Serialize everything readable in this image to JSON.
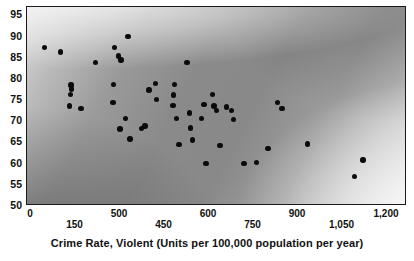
{
  "chart_data": {
    "type": "scatter",
    "title": "",
    "xlabel": "Crime Rate, Violent (Units per 100,000 population per year)",
    "ylabel": "",
    "xlim": [
      0,
      1300
    ],
    "ylim": [
      50,
      97
    ],
    "grid": false,
    "legend": null,
    "marker": {
      "shape": "circle",
      "color": "#0b0b0b",
      "filled": true
    },
    "background": {
      "style": "grayscale-gradient",
      "description": "dark gray in lower-left and upper-right, bright diagonal band from upper-left through centre to lower-right",
      "dark": "#8a8a8a",
      "light": "#e2e2e2"
    },
    "xticks_top": [
      "0",
      "500",
      "600",
      "900",
      "1,200"
    ],
    "xticks_bottom": [
      "150",
      "450",
      "750",
      "1,050"
    ],
    "xticks_all": [
      "0",
      "150",
      "500",
      "450",
      "600",
      "750",
      "900",
      "1,050",
      "1,200"
    ],
    "yticks": [
      "95",
      "90",
      "85",
      "80",
      "75",
      "70",
      "65",
      "60",
      "55",
      "50"
    ],
    "n_points": 60,
    "points": [
      {
        "x": 60,
        "y": 87.4
      },
      {
        "x": 115,
        "y": 86.4
      },
      {
        "x": 150,
        "y": 78.6
      },
      {
        "x": 152,
        "y": 77.6
      },
      {
        "x": 148,
        "y": 76.3
      },
      {
        "x": 146,
        "y": 73.6
      },
      {
        "x": 185,
        "y": 73.1
      },
      {
        "x": 235,
        "y": 83.9
      },
      {
        "x": 300,
        "y": 87.5
      },
      {
        "x": 312,
        "y": 85.4
      },
      {
        "x": 322,
        "y": 84.5
      },
      {
        "x": 345,
        "y": 90.0
      },
      {
        "x": 296,
        "y": 78.7
      },
      {
        "x": 294,
        "y": 74.4
      },
      {
        "x": 318,
        "y": 68.2
      },
      {
        "x": 336,
        "y": 70.7
      },
      {
        "x": 352,
        "y": 65.8
      },
      {
        "x": 392,
        "y": 68.3
      },
      {
        "x": 404,
        "y": 68.9
      },
      {
        "x": 418,
        "y": 77.4
      },
      {
        "x": 440,
        "y": 79.0
      },
      {
        "x": 444,
        "y": 75.2
      },
      {
        "x": 505,
        "y": 78.7
      },
      {
        "x": 502,
        "y": 76.2
      },
      {
        "x": 500,
        "y": 73.7
      },
      {
        "x": 512,
        "y": 70.6
      },
      {
        "x": 520,
        "y": 64.5
      },
      {
        "x": 548,
        "y": 83.9
      },
      {
        "x": 556,
        "y": 72.0
      },
      {
        "x": 560,
        "y": 68.4
      },
      {
        "x": 566,
        "y": 65.6
      },
      {
        "x": 596,
        "y": 70.6
      },
      {
        "x": 606,
        "y": 74.0
      },
      {
        "x": 612,
        "y": 60.0
      },
      {
        "x": 634,
        "y": 76.4
      },
      {
        "x": 640,
        "y": 73.6
      },
      {
        "x": 648,
        "y": 72.6
      },
      {
        "x": 660,
        "y": 64.3
      },
      {
        "x": 682,
        "y": 73.4
      },
      {
        "x": 700,
        "y": 72.6
      },
      {
        "x": 706,
        "y": 70.5
      },
      {
        "x": 742,
        "y": 60.1
      },
      {
        "x": 786,
        "y": 60.3
      },
      {
        "x": 824,
        "y": 63.6
      },
      {
        "x": 856,
        "y": 74.5
      },
      {
        "x": 872,
        "y": 73.0
      },
      {
        "x": 960,
        "y": 64.6
      },
      {
        "x": 1120,
        "y": 57.0
      },
      {
        "x": 1150,
        "y": 60.9
      }
    ]
  },
  "axes": {
    "xaxis_title": "Crime Rate, Violent (Units per 100,000 population per year)"
  }
}
